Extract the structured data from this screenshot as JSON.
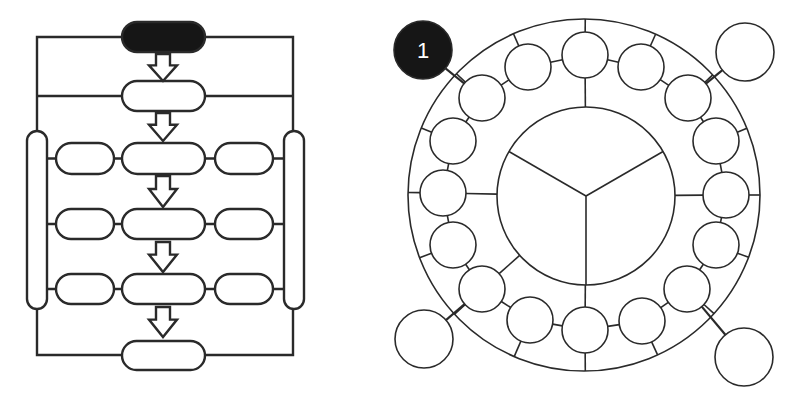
{
  "colors": {
    "stroke": "#2a2a2a",
    "fill": "#ffffff",
    "dark_fill": "#161616",
    "badge_text": "#ffffff"
  },
  "flowchart": {
    "stroke_width": 2.4,
    "frame": {
      "left_x": 37,
      "right_x": 293,
      "top_y": 37,
      "mid_y": 96,
      "bottom_y": 355
    },
    "side_bars": [
      {
        "id": "left",
        "x": 27,
        "y": 131,
        "w": 20,
        "h": 178
      },
      {
        "id": "right",
        "x": 284,
        "y": 131,
        "w": 20,
        "h": 178
      }
    ],
    "center_pills": [
      {
        "id": "start",
        "x": 122,
        "y": 22,
        "w": 83,
        "h": 30,
        "dark": true
      },
      {
        "id": "step-1",
        "x": 122,
        "y": 81,
        "w": 83,
        "h": 30,
        "dark": false
      },
      {
        "id": "step-2",
        "x": 122,
        "y": 143,
        "w": 83,
        "h": 31,
        "dark": false
      },
      {
        "id": "step-3",
        "x": 122,
        "y": 209,
        "w": 83,
        "h": 30,
        "dark": false
      },
      {
        "id": "step-4",
        "x": 122,
        "y": 274,
        "w": 83,
        "h": 30,
        "dark": false
      },
      {
        "id": "end",
        "x": 122,
        "y": 341,
        "w": 83,
        "h": 29,
        "dark": false
      }
    ],
    "side_pills": [
      {
        "id": "left-row-1",
        "x": 56,
        "y": 143,
        "w": 58,
        "h": 31
      },
      {
        "id": "right-row-1",
        "x": 215,
        "y": 143,
        "w": 58,
        "h": 31
      },
      {
        "id": "left-row-2",
        "x": 56,
        "y": 209,
        "w": 58,
        "h": 30
      },
      {
        "id": "right-row-2",
        "x": 215,
        "y": 209,
        "w": 58,
        "h": 30
      },
      {
        "id": "left-row-3",
        "x": 56,
        "y": 274,
        "w": 58,
        "h": 30
      },
      {
        "id": "right-row-3",
        "x": 215,
        "y": 274,
        "w": 58,
        "h": 30
      }
    ],
    "arrows": [
      {
        "cx": 163,
        "top": 54,
        "bottom": 81
      },
      {
        "cx": 163,
        "top": 113,
        "bottom": 141
      },
      {
        "cx": 163,
        "top": 176,
        "bottom": 207
      },
      {
        "cx": 163,
        "top": 242,
        "bottom": 272
      },
      {
        "cx": 163,
        "top": 307,
        "bottom": 337
      }
    ]
  },
  "ring_diagram": {
    "stroke_width": 1.6,
    "outer_ring": {
      "cx": 584,
      "cy": 195,
      "r": 176
    },
    "inner_circle": {
      "cx": 586,
      "cy": 196,
      "r": 89,
      "segments": 3
    },
    "small_circle_radius": 23,
    "small_circles": [
      {
        "cx": 585,
        "cy": 55
      },
      {
        "cx": 641,
        "cy": 67
      },
      {
        "cx": 688,
        "cy": 98
      },
      {
        "cx": 716,
        "cy": 141
      },
      {
        "cx": 726,
        "cy": 195
      },
      {
        "cx": 716,
        "cy": 245
      },
      {
        "cx": 687,
        "cy": 289
      },
      {
        "cx": 642,
        "cy": 321
      },
      {
        "cx": 585,
        "cy": 330
      },
      {
        "cx": 530,
        "cy": 320
      },
      {
        "cx": 482,
        "cy": 289
      },
      {
        "cx": 453,
        "cy": 245
      },
      {
        "cx": 443,
        "cy": 193
      },
      {
        "cx": 453,
        "cy": 141
      },
      {
        "cx": 482,
        "cy": 98
      },
      {
        "cx": 528,
        "cy": 67
      }
    ],
    "corner_circles": [
      {
        "id": "top-left-badge",
        "cx": 423,
        "cy": 50,
        "r": 29,
        "dark": true,
        "label": "1"
      },
      {
        "id": "top-right",
        "cx": 745,
        "cy": 52,
        "r": 29,
        "dark": false,
        "label": ""
      },
      {
        "id": "bottom-left",
        "cx": 424,
        "cy": 339,
        "r": 29,
        "dark": false,
        "label": ""
      },
      {
        "id": "bottom-right",
        "cx": 744,
        "cy": 357,
        "r": 29,
        "dark": false,
        "label": ""
      }
    ],
    "hub_links": [
      {
        "from_small": 0,
        "to": "inner"
      },
      {
        "from_small": 4,
        "to": "inner"
      },
      {
        "from_small": 8,
        "to": "inner"
      },
      {
        "from_small": 12,
        "to": "inner"
      },
      {
        "from_small": 10,
        "to": "inner"
      }
    ]
  }
}
